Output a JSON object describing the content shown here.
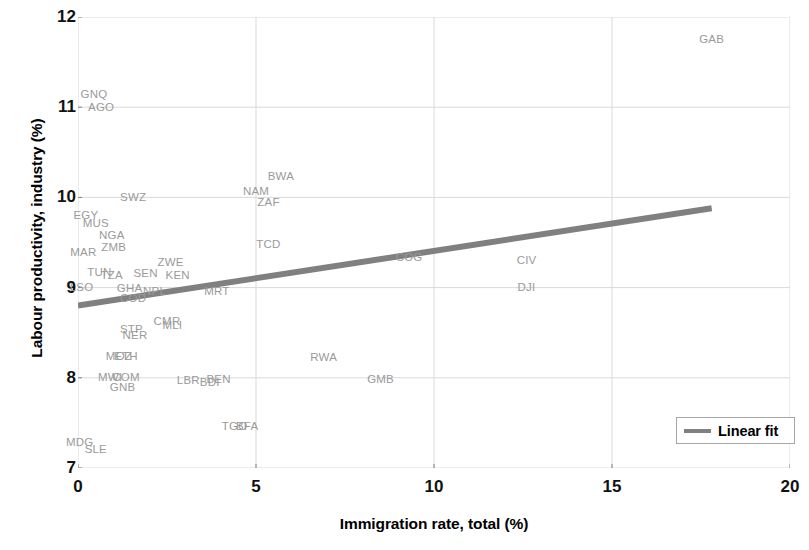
{
  "chart_data": {
    "type": "scatter",
    "title": "",
    "xlabel": "Immigration rate, total (%)",
    "ylabel": "Labour productivity, industry (%)",
    "xlim": [
      0,
      20
    ],
    "ylim": [
      7,
      12
    ],
    "xticks": [
      "0",
      "5",
      "10",
      "15",
      "20"
    ],
    "yticks": [
      "12",
      "11",
      "10",
      "9",
      "8",
      "7"
    ],
    "xtick_values": [
      0,
      5,
      10,
      15,
      20
    ],
    "ytick_values": [
      12,
      11,
      10,
      9,
      8,
      7
    ],
    "grid": true,
    "marker_style": "text-label-only",
    "point_label_color": "#9a9a9a",
    "points": [
      {
        "label": "GAB",
        "x": 17.8,
        "y": 11.75
      },
      {
        "label": "GNQ",
        "x": 0.45,
        "y": 11.13
      },
      {
        "label": "AGO",
        "x": 0.65,
        "y": 10.99
      },
      {
        "label": "BWA",
        "x": 5.7,
        "y": 10.23
      },
      {
        "label": "NAM",
        "x": 5.0,
        "y": 10.06
      },
      {
        "label": "SWZ",
        "x": 1.55,
        "y": 9.99
      },
      {
        "label": "ZAF",
        "x": 5.35,
        "y": 9.94
      },
      {
        "label": "EGY",
        "x": 0.22,
        "y": 9.79
      },
      {
        "label": "MUS",
        "x": 0.5,
        "y": 9.7
      },
      {
        "label": "NGA",
        "x": 0.95,
        "y": 9.57
      },
      {
        "label": "TCD",
        "x": 5.35,
        "y": 9.47
      },
      {
        "label": "ZMB",
        "x": 1.0,
        "y": 9.44
      },
      {
        "label": "MAR",
        "x": 0.15,
        "y": 9.38
      },
      {
        "label": "ZWE",
        "x": 2.6,
        "y": 9.27
      },
      {
        "label": "COG",
        "x": 9.3,
        "y": 9.33
      },
      {
        "label": "CIV",
        "x": 12.6,
        "y": 9.29
      },
      {
        "label": "TUN",
        "x": 0.6,
        "y": 9.16
      },
      {
        "label": "TZA",
        "x": 0.95,
        "y": 9.13
      },
      {
        "label": "SEN",
        "x": 1.9,
        "y": 9.15
      },
      {
        "label": "KEN",
        "x": 2.8,
        "y": 9.13
      },
      {
        "label": "LSO",
        "x": 0.1,
        "y": 9.0
      },
      {
        "label": "GHA",
        "x": 1.45,
        "y": 8.99
      },
      {
        "label": "NPL",
        "x": 2.15,
        "y": 8.95
      },
      {
        "label": "MRT",
        "x": 3.9,
        "y": 8.95
      },
      {
        "label": "DJI",
        "x": 12.6,
        "y": 9.0
      },
      {
        "label": "COD",
        "x": 1.55,
        "y": 8.87
      },
      {
        "label": "CMR",
        "x": 2.5,
        "y": 8.62
      },
      {
        "label": "MLI",
        "x": 2.65,
        "y": 8.57
      },
      {
        "label": "STP",
        "x": 1.5,
        "y": 8.53
      },
      {
        "label": "NER",
        "x": 1.6,
        "y": 8.46
      },
      {
        "label": "MOZ",
        "x": 1.15,
        "y": 8.23
      },
      {
        "label": "ETH",
        "x": 1.35,
        "y": 8.23
      },
      {
        "label": "RWA",
        "x": 6.9,
        "y": 8.22
      },
      {
        "label": "MWI",
        "x": 0.9,
        "y": 8.0
      },
      {
        "label": "COM",
        "x": 1.35,
        "y": 8.0
      },
      {
        "label": "LBR",
        "x": 3.1,
        "y": 7.97
      },
      {
        "label": "BDI",
        "x": 3.7,
        "y": 7.94
      },
      {
        "label": "BEN",
        "x": 3.95,
        "y": 7.98
      },
      {
        "label": "GMB",
        "x": 8.5,
        "y": 7.98
      },
      {
        "label": "GNB",
        "x": 1.25,
        "y": 7.89
      },
      {
        "label": "TGO",
        "x": 4.4,
        "y": 7.45
      },
      {
        "label": "BFA",
        "x": 4.75,
        "y": 7.45
      },
      {
        "label": "MDG",
        "x": 0.05,
        "y": 7.28
      },
      {
        "label": "SLE",
        "x": 0.5,
        "y": 7.2
      }
    ],
    "series": [
      {
        "name": "Linear fit",
        "type": "line",
        "color": "#808080",
        "line_width": 6,
        "x": [
          0.0,
          17.8
        ],
        "y": [
          8.8,
          9.88
        ]
      }
    ],
    "legend": {
      "position": "bottom-right",
      "entries": [
        {
          "label": "Linear fit",
          "color": "#808080",
          "marker": "line-swatch"
        }
      ]
    }
  },
  "axes": {
    "grid_color": "#d9d9d9",
    "tick_color": "#808080"
  }
}
